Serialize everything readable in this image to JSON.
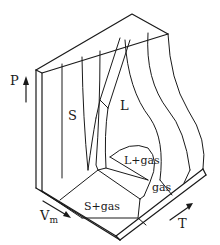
{
  "diagram": {
    "type": "P-V-T surface",
    "axes": {
      "pressure": "P",
      "volume": "V",
      "volume_subscript": "m",
      "temperature": "T"
    },
    "regions": {
      "solid": "S",
      "liquid": "L",
      "liquid_gas": "L+gas",
      "gas": "gas",
      "solid_gas": "S+gas"
    },
    "colors": {
      "line": "#1a1a1a",
      "background": "#ffffff"
    }
  }
}
